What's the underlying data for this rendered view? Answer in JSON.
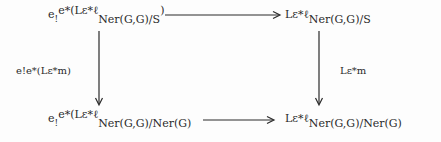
{
  "diagram": {
    "type": "commutative-square",
    "nodes": {
      "top_left": {
        "prefix": "e",
        "prefix_sub": "!",
        "main": "e*(Lε*ℓ",
        "sub": "Ner(G,G)/S",
        "close": ")"
      },
      "top_right": {
        "main": "Lε*ℓ",
        "sub": "Ner(G,G)/S"
      },
      "bottom_left": {
        "prefix": "e",
        "prefix_sub": "!",
        "main": "e*(Lε*ℓ",
        "sub": "Ner(G,G)/Ner(G)"
      },
      "bottom_right": {
        "main": "Lε*ℓ",
        "sub": "Ner(G,G)/Ner(G)"
      }
    },
    "arrows": {
      "top": {
        "from": "top_left",
        "to": "top_right",
        "label": ""
      },
      "bottom": {
        "from": "bottom_left",
        "to": "bottom_right",
        "label": ""
      },
      "left": {
        "from": "top_left",
        "to": "bottom_left",
        "label": "e!e*(Lε*m)",
        "label_prefix": "e",
        "label_prefix_sub": "!",
        "label_main": "e*(Lε*m)"
      },
      "right": {
        "from": "top_right",
        "to": "bottom_right",
        "label": "Lε*m"
      }
    },
    "colors": {
      "ink": "#2a2a2a",
      "background": "#fdfdfd"
    }
  }
}
